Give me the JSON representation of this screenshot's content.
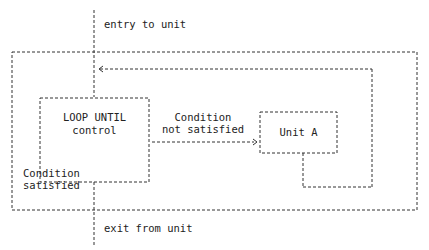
{
  "diagram": {
    "type": "flowchart",
    "title": "",
    "nodes": {
      "loop": {
        "line1": "LOOP UNTIL",
        "line2": "control"
      },
      "unit": {
        "label": "Unit A"
      }
    },
    "edges": {
      "entry": "entry to unit",
      "not_satisfied_line1": "Condition",
      "not_satisfied_line2": "not satisfied",
      "satisfied_line1": "Condition",
      "satisfied_line2": "satisfied",
      "exit": "exit from unit"
    },
    "style": {
      "line_color": "#333333",
      "dash": "3,2"
    }
  }
}
